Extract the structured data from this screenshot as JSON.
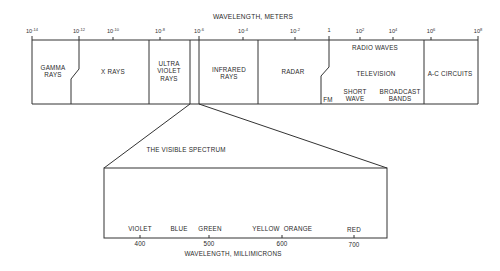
{
  "title": "WAVELENGTH, METERS",
  "axis_ticks": [
    {
      "base": "10",
      "exp": "-14",
      "x": 32
    },
    {
      "base": "10",
      "exp": "-12",
      "x": 79
    },
    {
      "base": "10",
      "exp": "-10",
      "x": 113
    },
    {
      "base": "10",
      "exp": "-8",
      "x": 160
    },
    {
      "base": "10",
      "exp": "-6",
      "x": 199
    },
    {
      "base": "10",
      "exp": "-4",
      "x": 243
    },
    {
      "base": "10",
      "exp": "-2",
      "x": 295
    },
    {
      "base": "1",
      "exp": "",
      "x": 329
    },
    {
      "base": "10",
      "exp": "2",
      "x": 360
    },
    {
      "base": "10",
      "exp": "4",
      "x": 393
    },
    {
      "base": "10",
      "exp": "6",
      "x": 431
    },
    {
      "base": "10",
      "exp": "8",
      "x": 478
    }
  ],
  "regions": {
    "gamma": {
      "line1": "GAMMA",
      "line2": "RAYS"
    },
    "xrays": {
      "label": "X RAYS"
    },
    "ultraviolet": {
      "line1": "ULTRA",
      "line2": "VIOLET",
      "line3": "RAYS"
    },
    "infrared": {
      "line1": "INFRARED",
      "line2": "RAYS"
    },
    "radar": {
      "label": "RADAR"
    },
    "radio": {
      "header": "RADIO WAVES",
      "television": "TELEVISION",
      "fm": "FM",
      "shortwave": {
        "line1": "SHORT",
        "line2": "WAVE"
      },
      "broadcast": {
        "line1": "BROADCAST",
        "line2": "BANDS"
      }
    },
    "ac": {
      "label": "A-C CIRCUITS"
    }
  },
  "visible": {
    "title": "THE VISIBLE SPECTRUM",
    "colors": [
      "VIOLET",
      "BLUE",
      "GREEN",
      "YELLOW",
      "ORANGE",
      "RED"
    ],
    "ticks": [
      "400",
      "500",
      "600",
      "700"
    ],
    "axis_label": "WAVELENGTH, MILLIMICRONS"
  },
  "style": {
    "line_color": "#333333",
    "background": "#ffffff"
  }
}
